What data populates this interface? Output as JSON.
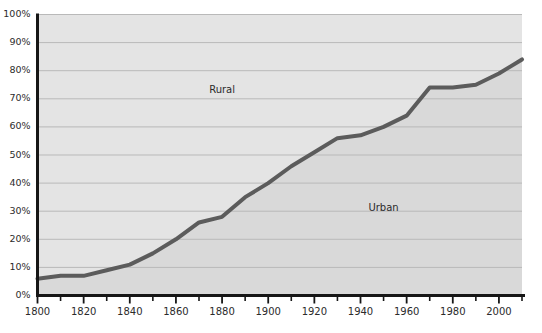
{
  "chart_data": {
    "type": "area",
    "title": "",
    "subtitle": "",
    "xlabel": "",
    "ylabel": "",
    "xlim": [
      1800,
      2010
    ],
    "ylim": [
      0,
      100
    ],
    "grid": true,
    "legend_position": "inline-annotations",
    "x": [
      1800,
      1810,
      1820,
      1830,
      1840,
      1850,
      1860,
      1870,
      1880,
      1890,
      1900,
      1910,
      1920,
      1930,
      1940,
      1950,
      1960,
      1970,
      1980,
      1990,
      2000,
      2010
    ],
    "series": [
      {
        "name": "Urban",
        "values": [
          6,
          7,
          7,
          9,
          11,
          15,
          20,
          26,
          28,
          35,
          40,
          46,
          51,
          56,
          57,
          60,
          64,
          74,
          74,
          75,
          79,
          84
        ]
      },
      {
        "name": "Rural",
        "values": [
          94,
          93,
          93,
          91,
          89,
          85,
          80,
          74,
          72,
          65,
          60,
          54,
          49,
          44,
          43,
          40,
          36,
          26,
          26,
          25,
          21,
          16
        ]
      }
    ],
    "annotations": [
      {
        "text": "Rural",
        "x": 1880,
        "y": 73
      },
      {
        "text": "Urban",
        "x": 1950,
        "y": 31
      }
    ],
    "y_ticks": [
      0,
      10,
      20,
      30,
      40,
      50,
      60,
      70,
      80,
      90,
      100
    ],
    "y_tick_labels": [
      "0%",
      "10%",
      "20%",
      "30%",
      "40%",
      "50%",
      "60%",
      "70%",
      "80%",
      "90%",
      "100%"
    ],
    "x_ticks_major": [
      1800,
      1820,
      1840,
      1860,
      1880,
      1900,
      1920,
      1940,
      1960,
      1980,
      2000
    ],
    "x_tick_labels": [
      "1800",
      "1820",
      "1840",
      "1860",
      "1880",
      "1900",
      "1920",
      "1940",
      "1960",
      "1980",
      "2000"
    ],
    "x_ticks_minor": [
      1810,
      1830,
      1850,
      1870,
      1890,
      1910,
      1930,
      1950,
      1970,
      1990,
      2010
    ],
    "colors": {
      "rural_fill": "#e4e4e4",
      "urban_fill": "#d9d9d9",
      "line": "#5c5c5c",
      "axis": "#161616",
      "gridline": "#b9b9b9",
      "text": "#2b2b2b",
      "background": "#ffffff"
    }
  }
}
